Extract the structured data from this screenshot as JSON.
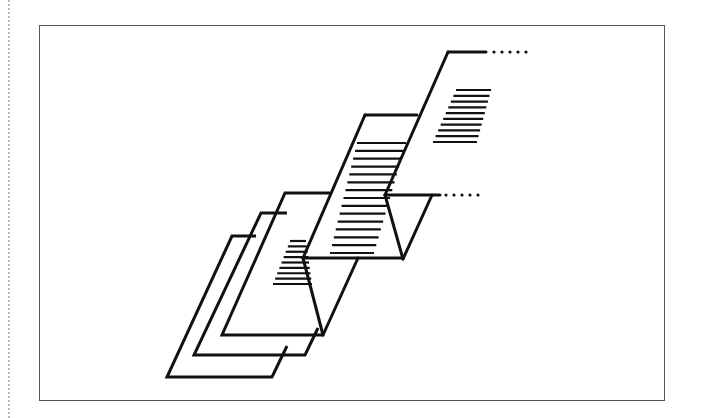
{
  "figure": {
    "stroke_color": "#111111",
    "frame_color": "#555555",
    "margin_color": "#b8b8b8",
    "canvas": {
      "width": 703,
      "height": 418
    },
    "frame": {
      "x": 39,
      "y": 25,
      "width": 626,
      "height": 376
    },
    "sheets": [
      {
        "name": "sheet-back",
        "points": "256,236 232,236 167,377 272,377 287,346"
      },
      {
        "name": "sheet-second",
        "points": "287,213 261,213 194,355 305,355 318,328"
      },
      {
        "name": "sheet-third",
        "points": "330,193 285,193 222,335 323,335"
      }
    ],
    "fold_lower": {
      "top_line": {
        "x1": 303,
        "y1": 258,
        "x2": 403,
        "y2": 258
      },
      "left_arm": {
        "x1": 303,
        "y1": 258,
        "x2": 323,
        "y2": 335
      },
      "right_arm": {
        "x1": 323,
        "y1": 335,
        "x2": 358,
        "y2": 258
      }
    },
    "sheet_middle": {
      "top_edge": {
        "x1": 365,
        "y1": 115,
        "x2": 417,
        "y2": 115
      },
      "left_edge": {
        "x1": 365,
        "y1": 115,
        "x2": 303,
        "y2": 258
      }
    },
    "fold_upper": {
      "top_line": {
        "x1": 385,
        "y1": 195,
        "x2": 440,
        "y2": 195
      },
      "left_arm": {
        "x1": 385,
        "y1": 195,
        "x2": 403,
        "y2": 259
      },
      "right_arm": {
        "x1": 403,
        "y1": 259,
        "x2": 432,
        "y2": 195
      },
      "continuation_dots": {
        "x_start": 446,
        "y": 195,
        "count": 5,
        "spacing": 8
      }
    },
    "sheet_top": {
      "top_edge": {
        "x1": 448,
        "y1": 52,
        "x2": 486,
        "y2": 52
      },
      "spine": {
        "x1": 448,
        "y1": 52,
        "x2": 385,
        "y2": 195
      },
      "continuation_dots": {
        "x_start": 494,
        "y": 52,
        "count": 5,
        "spacing": 8
      }
    },
    "text_hatching": {
      "third_sheet": {
        "count": 9,
        "y_start": 241,
        "y_end": 284,
        "left_start": 290,
        "left_end": 273,
        "right_start": 306,
        "right_end": 312
      },
      "middle_sheet": {
        "count": 15,
        "y_start": 143,
        "y_end": 253,
        "left_start": 357,
        "left_end": 330,
        "right_start": 406,
        "right_end": 374
      },
      "top_sheet": {
        "count": 10,
        "y_start": 90,
        "y_end": 142,
        "left_start": 456,
        "left_end": 433,
        "right_start": 491,
        "right_end": 477
      }
    }
  }
}
